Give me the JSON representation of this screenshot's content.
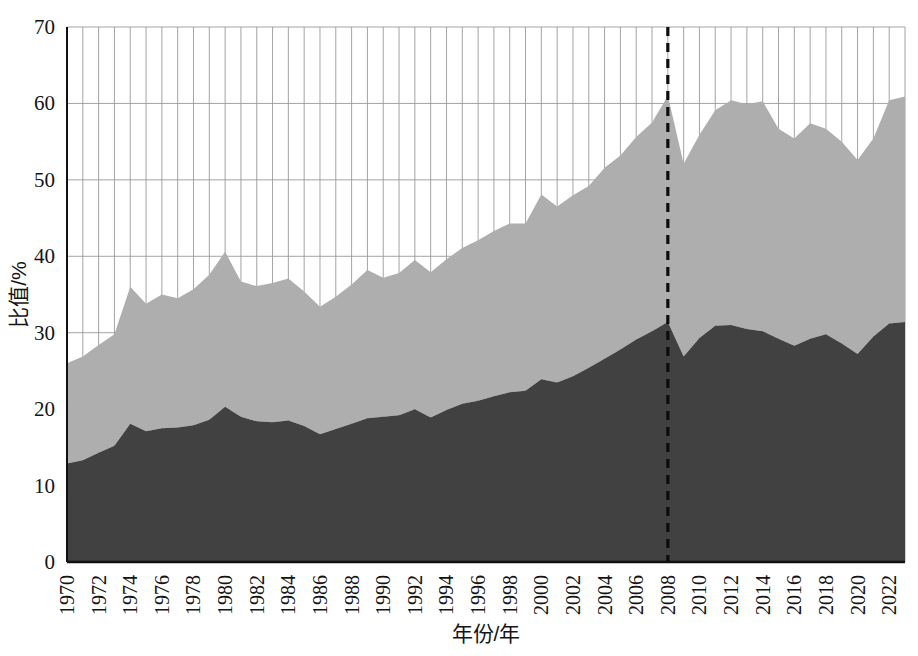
{
  "figure": {
    "background": "#ffffff",
    "plot_background": "#ffffff"
  },
  "axis": {
    "y_title": "比值/%",
    "x_title": "年份/年",
    "y_ticks": [
      "0",
      "10",
      "20",
      "30",
      "40",
      "50",
      "60",
      "70"
    ],
    "x_ticks": [
      "1970",
      "1972",
      "1974",
      "1976",
      "1978",
      "1980",
      "1982",
      "1984",
      "1986",
      "1988",
      "1990",
      "1992",
      "1994",
      "1996",
      "1998",
      "2000",
      "2002",
      "2004",
      "2006",
      "2008",
      "2010",
      "2012",
      "2014",
      "2016",
      "2018",
      "2020",
      "2022"
    ]
  },
  "style": {
    "series_lower_color": "#414141",
    "series_upper_color": "#aeaeae",
    "gridline_color": "#9a9a9a",
    "axis_line_color": "#101010",
    "marker_line_color": "#0d0d0d"
  },
  "annotations": [
    {
      "name": "year-2008-marker",
      "type": "vertical-dashed-line",
      "x_value": 2008,
      "color": "#0d0d0d"
    }
  ],
  "chart_data": {
    "type": "area",
    "stacked": true,
    "title": "",
    "xlabel": "年份/年",
    "ylabel": "比值/%",
    "xlim": [
      1970,
      2023
    ],
    "ylim": [
      0,
      70
    ],
    "grid": true,
    "legend": "none",
    "x": [
      1970,
      1971,
      1972,
      1973,
      1974,
      1975,
      1976,
      1977,
      1978,
      1979,
      1980,
      1981,
      1982,
      1983,
      1984,
      1985,
      1986,
      1987,
      1988,
      1989,
      1990,
      1991,
      1992,
      1993,
      1994,
      1995,
      1996,
      1997,
      1998,
      1999,
      2000,
      2001,
      2002,
      2003,
      2004,
      2005,
      2006,
      2007,
      2008,
      2009,
      2010,
      2011,
      2012,
      2013,
      2014,
      2015,
      2016,
      2017,
      2018,
      2019,
      2020,
      2021,
      2022,
      2023
    ],
    "series": [
      {
        "name": "lower-series",
        "color": "#414141",
        "values": [
          12.9,
          13.3,
          14.3,
          15.2,
          18.1,
          17.1,
          17.5,
          17.6,
          17.9,
          18.6,
          20.3,
          19.0,
          18.4,
          18.3,
          18.5,
          17.8,
          16.7,
          17.4,
          18.1,
          18.8,
          19.0,
          19.2,
          20.0,
          18.9,
          19.9,
          20.7,
          21.1,
          21.7,
          22.2,
          22.4,
          23.9,
          23.5,
          24.3,
          25.4,
          26.6,
          27.8,
          29.1,
          30.2,
          31.4,
          26.9,
          29.3,
          30.9,
          31.0,
          30.5,
          30.2,
          29.2,
          28.3,
          29.2,
          29.8,
          28.6,
          27.2,
          29.5,
          31.2,
          31.4
        ],
        "marker_2008_value": 31.4
      },
      {
        "name": "upper-series",
        "color": "#aeaeae",
        "values": [
          13.1,
          13.6,
          14.1,
          14.6,
          17.9,
          16.7,
          17.5,
          16.9,
          17.8,
          19.0,
          20.3,
          17.7,
          17.7,
          18.2,
          18.6,
          17.6,
          16.7,
          17.3,
          18.2,
          19.4,
          18.2,
          18.6,
          19.5,
          19.0,
          19.7,
          20.4,
          21.0,
          21.6,
          22.1,
          21.9,
          24.2,
          23.0,
          23.7,
          23.8,
          25.0,
          25.4,
          26.5,
          27.3,
          29.6,
          25.2,
          26.6,
          28.2,
          29.4,
          29.4,
          30.1,
          27.5,
          27.1,
          28.2,
          26.9,
          26.4,
          25.4,
          25.9,
          29.2,
          29.5
        ]
      }
    ],
    "totals": [
      26.0,
      26.9,
      28.4,
      29.8,
      36.0,
      33.8,
      35.0,
      34.5,
      35.7,
      37.6,
      40.6,
      36.7,
      36.1,
      36.5,
      37.1,
      35.4,
      33.4,
      34.7,
      36.3,
      38.2,
      37.2,
      37.8,
      39.5,
      37.9,
      39.6,
      41.1,
      42.1,
      43.3,
      44.3,
      44.3,
      48.1,
      46.5,
      48.0,
      49.2,
      51.6,
      53.2,
      55.6,
      57.5,
      61.0,
      52.1,
      55.9,
      59.1,
      60.4,
      59.9,
      60.3,
      56.7,
      55.4,
      57.4,
      56.7,
      55.0,
      52.6,
      55.4,
      60.4,
      60.9
    ]
  }
}
